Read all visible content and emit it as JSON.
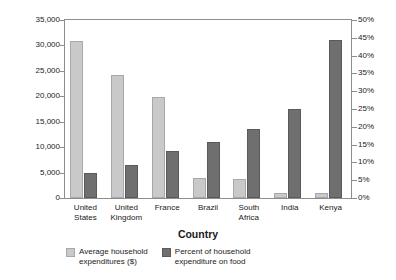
{
  "chart_data": {
    "type": "bar",
    "title": "",
    "xlabel": "Country",
    "ylabel_left": "Household expenditures\n(constant 2005 $US)",
    "ylabel_right": "",
    "categories": [
      "United\nStates",
      "United\nKingdom",
      "France",
      "Brazil",
      "South\nAfrica",
      "India",
      "Kenya"
    ],
    "series": [
      {
        "name": "Average household\nexpenditures ($)",
        "axis": "left",
        "color": "#c9c9c9",
        "values": [
          30800,
          24100,
          19800,
          4000,
          3700,
          1000,
          950
        ]
      },
      {
        "name": "Percent of household\nexpenditure on food",
        "axis": "right",
        "color": "#6f6f6f",
        "values": [
          7,
          9.3,
          13.2,
          15.8,
          19.3,
          25,
          44.5
        ]
      }
    ],
    "ylim_left": [
      0,
      35000
    ],
    "ylim_right": [
      0,
      50
    ],
    "yticks_left": [
      "0",
      "5,000",
      "10,000",
      "15,000",
      "20,000",
      "25,000",
      "30,000",
      "35,000"
    ],
    "yticks_left_values": [
      0,
      5000,
      10000,
      15000,
      20000,
      25000,
      30000,
      35000
    ],
    "yticks_right": [
      "0%",
      "5%",
      "10%",
      "15%",
      "20%",
      "25%",
      "30%",
      "35%",
      "40%",
      "45%",
      "50%"
    ],
    "yticks_right_values": [
      0,
      5,
      10,
      15,
      20,
      25,
      30,
      35,
      40,
      45,
      50
    ],
    "grid": false,
    "legend_position": "bottom"
  }
}
